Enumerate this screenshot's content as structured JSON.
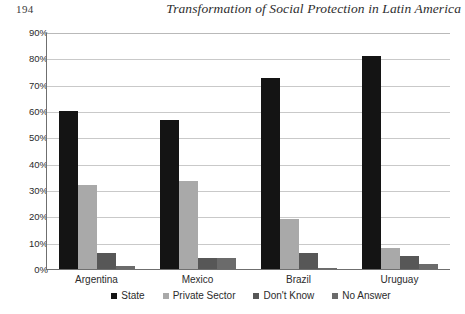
{
  "page": {
    "folio": "194",
    "running_title": "Transformation of Social Protection in Latin America"
  },
  "chart_data": {
    "type": "bar",
    "title": "",
    "xlabel": "",
    "ylabel": "",
    "ylim": [
      0,
      90
    ],
    "yticks": [
      "90%",
      "80%",
      "70%",
      "60%",
      "50%",
      "40%",
      "30%",
      "20%",
      "10%",
      "0%"
    ],
    "ytick_values": [
      90,
      80,
      70,
      60,
      50,
      40,
      30,
      20,
      10,
      0
    ],
    "grid": true,
    "legend_position": "bottom",
    "categories": [
      "Argentina",
      "Mexico",
      "Brazil",
      "Uruguay"
    ],
    "series": [
      {
        "name": "State",
        "color": "#141414",
        "values": [
          60,
          56.5,
          72.5,
          81
        ]
      },
      {
        "name": "Private Sector",
        "color": "#a9a9a9",
        "values": [
          32,
          33.5,
          19,
          8
        ]
      },
      {
        "name": "Don't Know",
        "color": "#575757",
        "values": [
          6,
          4,
          6,
          5
        ]
      },
      {
        "name": "No Answer",
        "color": "#6b6b6b",
        "values": [
          1,
          4,
          0.5,
          2
        ]
      }
    ]
  }
}
